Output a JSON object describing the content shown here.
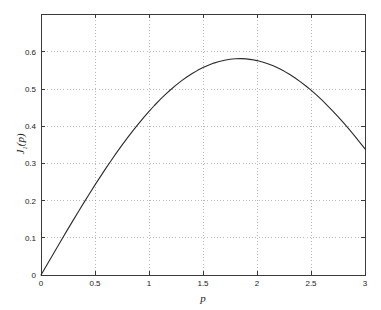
{
  "figure": {
    "background_color": "#ffffff",
    "axes_color": "#3a3a3a",
    "grid_color": "#9a9a9a",
    "curve_color": "#2b2b2b"
  },
  "chart_data": {
    "type": "line",
    "title": "",
    "subtitle": "",
    "xlabel": "p",
    "ylabel": "J_1(p)",
    "ylabel_base": "J",
    "ylabel_sub": "1",
    "ylabel_arg": "(p)",
    "xlim": [
      0,
      3
    ],
    "ylim": [
      0,
      0.702
    ],
    "grid": true,
    "grid_style": "dotted",
    "legend": "none",
    "xticks": [
      0,
      0.5,
      1,
      1.5,
      2,
      2.5,
      3
    ],
    "xticklabels": [
      "0",
      "0.5",
      "1",
      "1.5",
      "2",
      "2.5",
      "3"
    ],
    "yticks": [
      0,
      0.1,
      0.2,
      0.3,
      0.4,
      0.5,
      0.6
    ],
    "yticklabels": [
      "0",
      "0.1",
      "0.2",
      "0.3",
      "0.4",
      "0.5",
      "0.6"
    ],
    "series": [
      {
        "name": "J1(p)",
        "color": "#2b2b2b",
        "x": [
          0.0,
          0.05,
          0.1,
          0.15,
          0.2,
          0.25,
          0.3,
          0.35,
          0.4,
          0.45,
          0.5,
          0.55,
          0.6,
          0.65,
          0.7,
          0.75,
          0.8,
          0.85,
          0.9,
          0.95,
          1.0,
          1.05,
          1.1,
          1.15,
          1.2,
          1.25,
          1.3,
          1.35,
          1.4,
          1.45,
          1.5,
          1.55,
          1.6,
          1.65,
          1.7,
          1.75,
          1.8,
          1.85,
          1.9,
          1.95,
          2.0,
          2.05,
          2.1,
          2.15,
          2.2,
          2.25,
          2.3,
          2.35,
          2.4,
          2.45,
          2.5,
          2.55,
          2.6,
          2.65,
          2.7,
          2.75,
          2.8,
          2.85,
          2.9,
          2.95,
          3.0
        ],
        "y": [
          0.0,
          0.025,
          0.0499,
          0.0748,
          0.0995,
          0.124,
          0.1483,
          0.1723,
          0.196,
          0.2194,
          0.2423,
          0.2647,
          0.2867,
          0.3081,
          0.329,
          0.3492,
          0.3688,
          0.3878,
          0.4059,
          0.4234,
          0.4401,
          0.4559,
          0.4709,
          0.485,
          0.4983,
          0.5106,
          0.522,
          0.5324,
          0.5419,
          0.5504,
          0.5579,
          0.5644,
          0.5699,
          0.5743,
          0.5778,
          0.5802,
          0.5815,
          0.5819,
          0.5812,
          0.5794,
          0.5767,
          0.573,
          0.5683,
          0.5626,
          0.556,
          0.5484,
          0.5399,
          0.5305,
          0.5202,
          0.5091,
          0.4971,
          0.4843,
          0.4708,
          0.4565,
          0.4416,
          0.4259,
          0.4097,
          0.3928,
          0.3754,
          0.3575,
          0.3391
        ],
        "peak": {
          "x": 1.8412,
          "y": 0.5819
        },
        "endpoints": {
          "start": {
            "x": 0,
            "y": 0
          },
          "end": {
            "x": 3,
            "y": 0.3391
          }
        }
      }
    ]
  }
}
